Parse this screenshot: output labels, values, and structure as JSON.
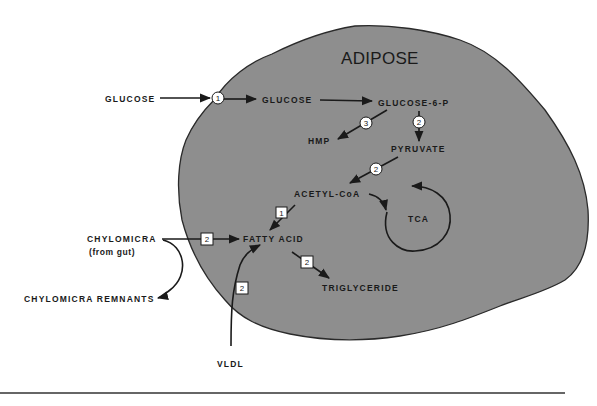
{
  "diagram": {
    "title": "ADIPOSE",
    "colors": {
      "cell_fill": "#8e8e8e",
      "cell_outline": "#2a2a2a",
      "ink": "#1a1a1a",
      "background": "#ffffff"
    },
    "nodes": {
      "glucose_ext": "GLUCOSE",
      "glucose_int": "GLUCOSE",
      "g6p": "GLUCOSE-6-P",
      "hmp": "HMP",
      "pyruvate": "PYRUVATE",
      "acetyl_coa": "ACETYL-CoA",
      "tca": "TCA",
      "fatty_acid": "FATTY  ACID",
      "triglyceride": "TRIGLYCERIDE",
      "chylomicra": "CHYLOMICRA",
      "chylomicra_sub": "(from gut)",
      "chylomicra_remnants": "CHYLOMICRA REMNANTS",
      "vldl": "VLDL"
    },
    "markers": {
      "glucose_transport": {
        "label": "1",
        "shape": "circle"
      },
      "g6p_to_hmp": {
        "label": "3",
        "shape": "circle"
      },
      "g6p_to_pyruvate": {
        "label": "2",
        "shape": "circle"
      },
      "pyruvate_to_acetyl": {
        "label": "2",
        "shape": "circle"
      },
      "acetyl_to_fatty": {
        "label": "1",
        "shape": "square"
      },
      "chylomicra_to_fatty": {
        "label": "2",
        "shape": "square"
      },
      "vldl_to_fatty": {
        "label": "2",
        "shape": "square"
      },
      "fatty_to_triglyceride": {
        "label": "2",
        "shape": "square"
      }
    }
  }
}
